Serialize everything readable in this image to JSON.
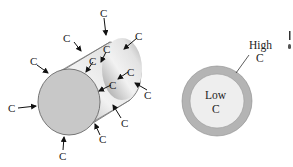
{
  "figure": {
    "left_panel": {
      "name": "cylinder-diffusion",
      "surface_label": "C",
      "arrow_labels": [
        "C",
        "C",
        "C",
        "C",
        "C",
        "C",
        "C",
        "C",
        "C",
        "C",
        "C",
        "C",
        "C"
      ]
    },
    "right_panel": {
      "name": "cross-section",
      "outer_label_line1": "High",
      "outer_label_line2": "C",
      "inner_label_line1": "Low",
      "inner_label_line2": "C"
    },
    "colors": {
      "cylinder_face": "#c8c8c8",
      "cylinder_body_light": "#ececec",
      "cylinder_body_dark": "#9a9a9a",
      "ring_outer": "#b4b4b4",
      "ring_inner": "#eeeeee",
      "stroke": "#6a6a6a",
      "text": "#222222"
    }
  }
}
